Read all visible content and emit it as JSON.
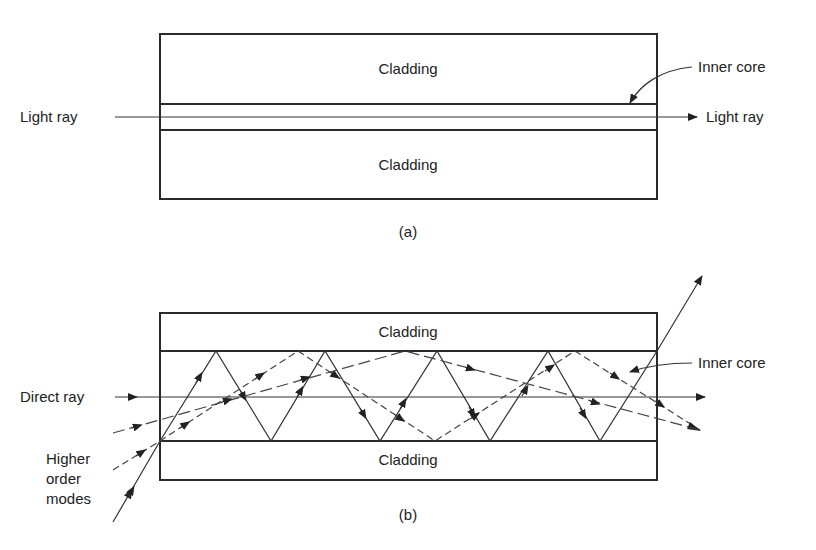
{
  "diagram_a": {
    "caption": "(a)",
    "cladding_top_label": "Cladding",
    "cladding_bottom_label": "Cladding",
    "inner_core_label": "Inner core",
    "input_label": "Light ray",
    "output_label": "Light ray"
  },
  "diagram_b": {
    "caption": "(b)",
    "cladding_top_label": "Cladding",
    "cladding_bottom_label": "Cladding",
    "inner_core_label": "Inner core",
    "direct_ray_label": "Direct ray",
    "higher_order_label_line1": "Higher",
    "higher_order_label_line2": "order",
    "higher_order_label_line3": "modes"
  },
  "colors": {
    "line": "#2a2a2a",
    "background": "#ffffff"
  }
}
